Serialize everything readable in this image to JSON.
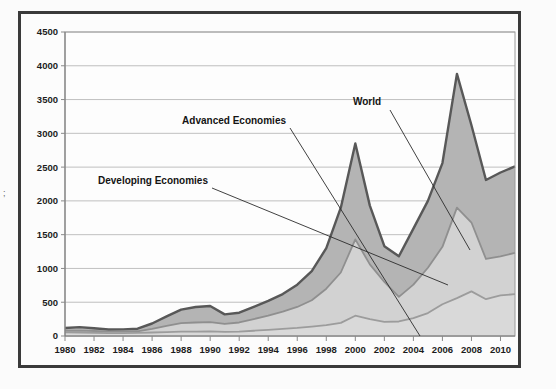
{
  "chart_data": {
    "type": "area",
    "stacked": true,
    "title": "",
    "subtitle": "",
    "xlabel": "",
    "ylabel": "",
    "xlim": [
      1980,
      2011
    ],
    "ylim": [
      0,
      4500
    ],
    "grid": true,
    "legend_position": "inline-annotations",
    "x": [
      1980,
      1981,
      1982,
      1983,
      1984,
      1985,
      1986,
      1987,
      1988,
      1989,
      1990,
      1991,
      1992,
      1993,
      1994,
      1995,
      1996,
      1997,
      1998,
      1999,
      2000,
      2001,
      2002,
      2003,
      2004,
      2005,
      2006,
      2007,
      2008,
      2009,
      2010,
      2011
    ],
    "x_tick_labels": [
      "1980",
      "1982",
      "1984",
      "1986",
      "1988",
      "1990",
      "1992",
      "1994",
      "1996",
      "1998",
      "2000",
      "2002",
      "2004",
      "2006",
      "2008",
      "2010"
    ],
    "y_tick_labels": [
      "0",
      "500",
      "1000",
      "1500",
      "2000",
      "2500",
      "3000",
      "3500",
      "4000",
      "4500"
    ],
    "y_ticks": [
      0,
      500,
      1000,
      1500,
      2000,
      2500,
      3000,
      3500,
      4000,
      4500
    ],
    "series": [
      {
        "name": "Developing Economies",
        "band": "bottom",
        "fill": "#d9d9d9",
        "stroke": "#9c9c9c",
        "values": [
          55,
          52,
          48,
          44,
          44,
          46,
          52,
          58,
          64,
          66,
          68,
          62,
          66,
          78,
          90,
          105,
          120,
          140,
          160,
          195,
          300,
          250,
          210,
          215,
          265,
          340,
          470,
          560,
          660,
          545,
          600,
          620
        ]
      },
      {
        "name": "Advanced Economies",
        "band": "middle",
        "fill": "#d2d2d2",
        "stroke": "#8f8f8f",
        "cumulative_values": [
          78,
          80,
          74,
          66,
          66,
          70,
          105,
          150,
          190,
          200,
          205,
          178,
          200,
          250,
          300,
          360,
          430,
          530,
          700,
          940,
          1430,
          1060,
          800,
          580,
          760,
          1010,
          1320,
          1900,
          1680,
          1140,
          1180,
          1230
        ]
      },
      {
        "name": "World",
        "band": "top",
        "fill": "#b4b4b4",
        "stroke": "#585858",
        "values": [
          118,
          132,
          115,
          96,
          98,
          108,
          185,
          290,
          390,
          430,
          445,
          320,
          345,
          430,
          520,
          620,
          760,
          960,
          1300,
          1900,
          2850,
          1930,
          1330,
          1180,
          1590,
          2000,
          2560,
          3880,
          3120,
          2310,
          2420,
          2510
        ]
      }
    ],
    "annotations": [
      {
        "label": "Advanced Economies",
        "anchor": "end",
        "label_x": 286,
        "label_y": 124,
        "leader": [
          [
            290,
            128
          ],
          [
            420,
            336
          ]
        ]
      },
      {
        "label": "World",
        "anchor": "start",
        "label_x": 353,
        "label_y": 105,
        "leader": [
          [
            390,
            110
          ],
          [
            470,
            250
          ]
        ]
      },
      {
        "label": "Developing Economies",
        "anchor": "end",
        "label_x": 208,
        "label_y": 184,
        "leader": [
          [
            212,
            188
          ],
          [
            448,
            285
          ]
        ]
      }
    ],
    "colors": {
      "frame": "#3a3a3a",
      "grid": "#b9b9b9",
      "world_fill": "#b4b4b4",
      "advanced_fill": "#d2d2d2",
      "developing_fill": "#d9d9d9",
      "world_stroke": "#585858",
      "text": "#141414",
      "background": "#fcfcfc"
    }
  }
}
